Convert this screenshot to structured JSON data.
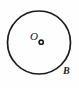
{
  "figure": {
    "type": "geometry-diagram",
    "canvas": {
      "width": 79,
      "height": 88
    },
    "background_color": "#fefefe",
    "stroke_color": "#1a1a1a",
    "text_color": "#1a1a1a",
    "circle": {
      "name": "boundary-circle",
      "center_x": 39,
      "center_y": 42.5,
      "radius": 31.5,
      "stroke_width": 1.7,
      "fill": "none"
    },
    "center_point": {
      "name": "center-point-marker",
      "x": 41.2,
      "y": 42.2,
      "radius": 2.1,
      "stroke_width": 1.6,
      "fill": "none"
    },
    "labels": [
      {
        "id": "center",
        "text": "O",
        "name": "center-label",
        "x": 30,
        "y": 31,
        "font_size": 11,
        "italic": true,
        "bold": false
      },
      {
        "id": "boundary",
        "text": "B",
        "name": "boundary-label",
        "x": 63,
        "y": 66,
        "font_size": 10,
        "italic": true,
        "bold": true
      }
    ]
  }
}
